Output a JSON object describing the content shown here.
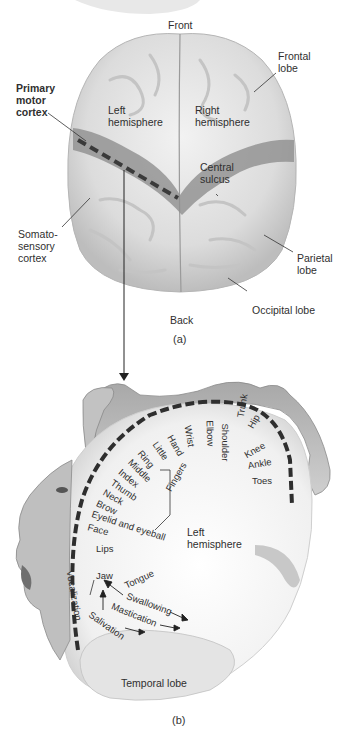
{
  "panel_a": {
    "caption": "(a)",
    "labels": {
      "front": "Front",
      "back": "Back",
      "frontal_lobe": "Frontal\nlobe",
      "primary_motor_cortex": "Primary\nmotor\ncortex",
      "left_hemisphere": "Left\nhemisphere",
      "right_hemisphere": "Right\nhemisphere",
      "central_sulcus": "Central\nsulcus",
      "somatosensory_cortex": "Somato-\nsensory\ncortex",
      "parietal_lobe": "Parietal\nlobe",
      "occipital_lobe": "Occipital lobe"
    }
  },
  "panel_b": {
    "caption": "(b)",
    "labels": {
      "left_hemisphere": "Left\nhemisphere",
      "temporal_lobe": "Temporal lobe",
      "fingers": "Fingers"
    },
    "body_parts": [
      "Toes",
      "Ankle",
      "Knee",
      "Hip",
      "Trunk",
      "Shoulder",
      "Elbow",
      "Wrist",
      "Hand",
      "Little",
      "Ring",
      "Middle",
      "Index",
      "Thumb",
      "Neck",
      "Brow",
      "Eyelid and eyeball",
      "Face",
      "Lips",
      "Jaw",
      "Tongue",
      "Swallowing",
      "Vocalization",
      "Salivation",
      "Mastication"
    ]
  },
  "colors": {
    "brain_light": "#e4e4e4",
    "brain_mid": "#c8c8c8",
    "motor_strip": "#8f8f8f",
    "dash": "#3a3a3a",
    "text": "#2f2f2f"
  }
}
